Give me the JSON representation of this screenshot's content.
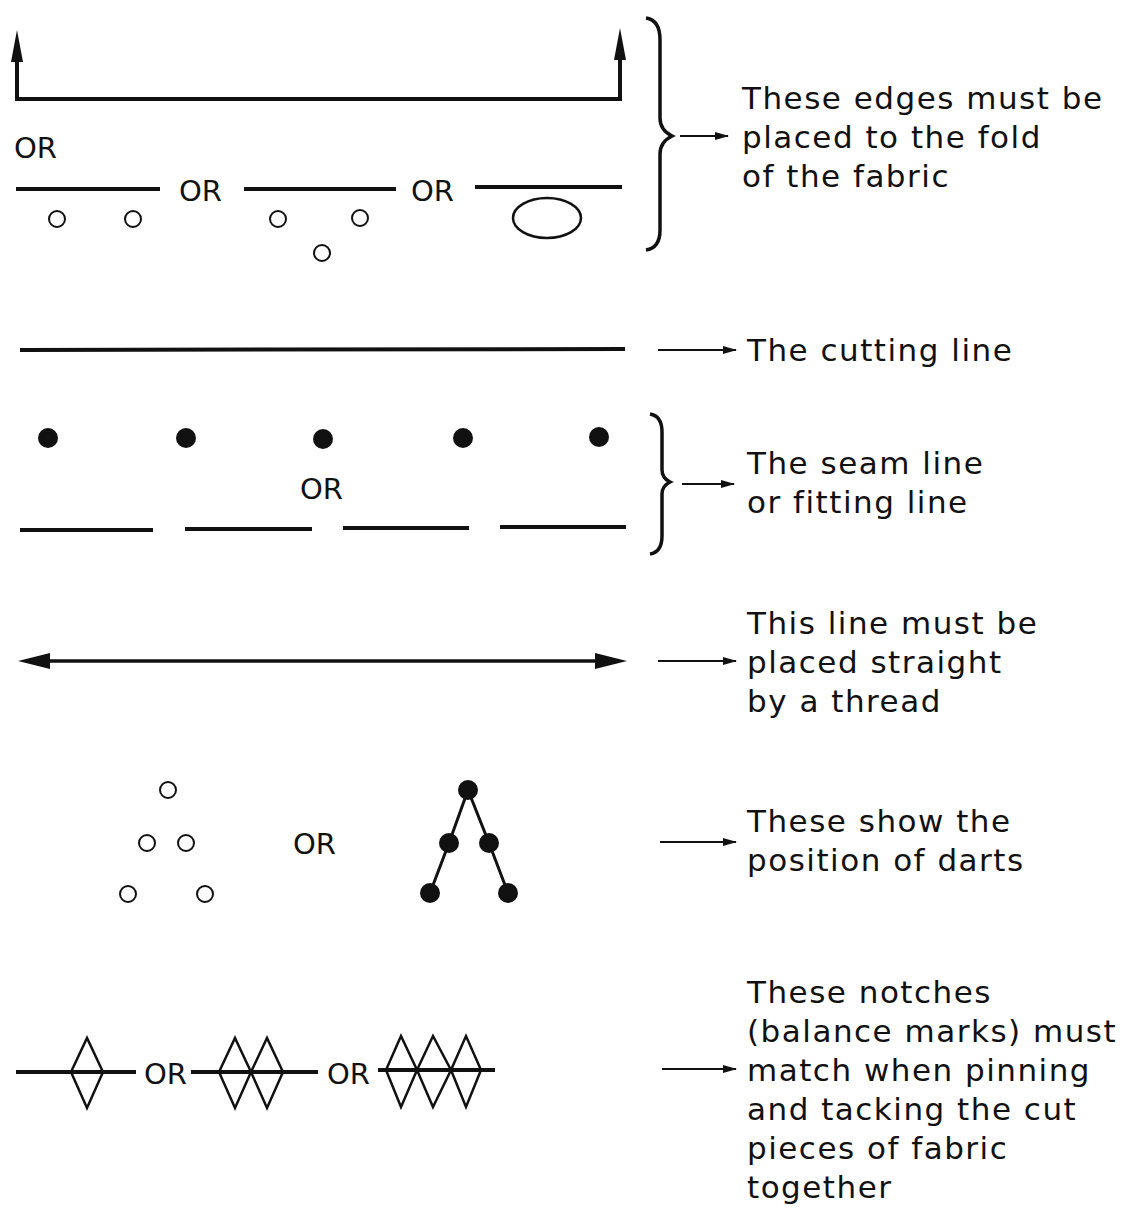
{
  "colors": {
    "ink": "#111111",
    "background": "#ffffff"
  },
  "or_label": "OR",
  "rows": [
    {
      "id": "fold",
      "symbols": [
        "fold-bracket-arrows",
        "solid-line-with-two-circles",
        "solid-line-with-three-circles",
        "solid-line-with-oval"
      ],
      "or_labels": [
        "OR",
        "OR",
        "OR"
      ],
      "description_lines": [
        "These edges must be",
        "placed to the fold",
        "of the fabric"
      ]
    },
    {
      "id": "cutting",
      "symbols": [
        "solid-line"
      ],
      "description_lines": [
        "The cutting line"
      ]
    },
    {
      "id": "seam",
      "symbols": [
        "row-of-dots",
        "dashed-line"
      ],
      "or_labels": [
        "OR"
      ],
      "description_lines": [
        "The seam line",
        "or fitting line"
      ]
    },
    {
      "id": "grain",
      "symbols": [
        "double-headed-arrow"
      ],
      "description_lines": [
        "This line must be",
        "placed straight",
        "by a thread"
      ]
    },
    {
      "id": "darts",
      "symbols": [
        "open-circle-triangle",
        "filled-dot-chevron"
      ],
      "or_labels": [
        "OR"
      ],
      "description_lines": [
        "These show the",
        "position of darts"
      ]
    },
    {
      "id": "notches",
      "symbols": [
        "single-diamond",
        "double-diamond",
        "triple-diamond"
      ],
      "or_labels": [
        "OR",
        "OR"
      ],
      "description_lines": [
        "These notches",
        "(balance marks) must",
        "match when pinning",
        "and tacking the cut",
        "pieces of fabric",
        "together"
      ]
    }
  ]
}
